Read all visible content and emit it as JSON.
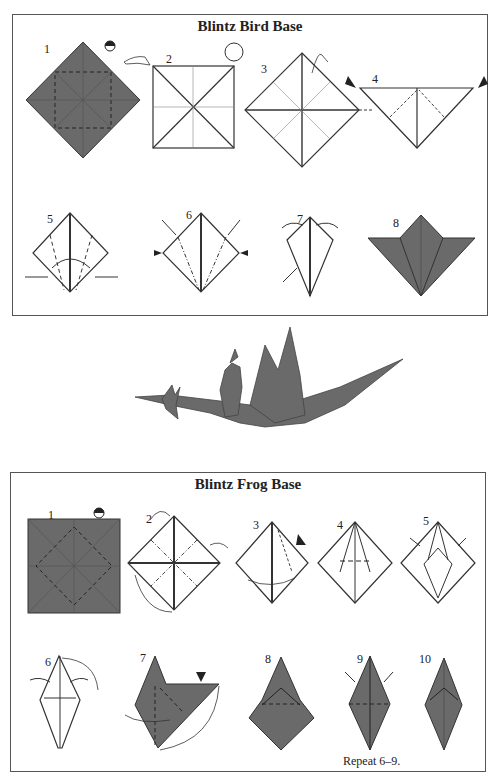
{
  "colors": {
    "paper_dark": "#6a6a6a",
    "paper_light": "#ffffff",
    "line": "#333333",
    "border": "#555555"
  },
  "bird_base": {
    "title": "Blintz Bird Base",
    "steps": [
      "1",
      "2",
      "3",
      "4",
      "5",
      "6",
      "7",
      "8"
    ]
  },
  "dragon_image": {
    "description": "Origami dragon with rider"
  },
  "frog_base": {
    "title": "Blintz Frog Base",
    "steps": [
      "1",
      "2",
      "3",
      "4",
      "5",
      "6",
      "7",
      "8",
      "9",
      "10"
    ],
    "caption": "Repeat 6–9."
  }
}
